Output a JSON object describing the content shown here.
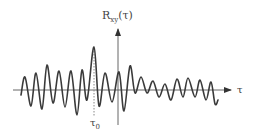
{
  "diagram": {
    "y_axis_label": {
      "main": "R",
      "sub": "xy",
      "arg": "(τ)"
    },
    "x_axis_label": "τ",
    "marker_label": {
      "main": "τ",
      "sub": "0"
    },
    "colors": {
      "curve": "#3a3a3a",
      "axis": "#555555",
      "marker": "#888888"
    }
  },
  "chart_data": {
    "type": "line",
    "xlabel": "τ",
    "ylabel": "R_xy(τ)",
    "annotations": [
      "τ0 (dashed line at maximum peak)"
    ],
    "points_px": [
      [
        21,
        95
      ],
      [
        25,
        77
      ],
      [
        31,
        106
      ],
      [
        36,
        73
      ],
      [
        42,
        109
      ],
      [
        47,
        65
      ],
      [
        53,
        103
      ],
      [
        59,
        71
      ],
      [
        65,
        107
      ],
      [
        71,
        71
      ],
      [
        77,
        115
      ],
      [
        82,
        70
      ],
      [
        87,
        100
      ],
      [
        94,
        47
      ],
      [
        99,
        106
      ],
      [
        105,
        73
      ],
      [
        112,
        102
      ],
      [
        119,
        72
      ],
      [
        124,
        111
      ],
      [
        130,
        66
      ],
      [
        135,
        93
      ],
      [
        141,
        77
      ],
      [
        147,
        93
      ],
      [
        153,
        81
      ],
      [
        159,
        97
      ],
      [
        165,
        84
      ],
      [
        171,
        100
      ],
      [
        177,
        79
      ],
      [
        183,
        97
      ],
      [
        188,
        78
      ],
      [
        195,
        97
      ],
      [
        200,
        80
      ],
      [
        206,
        100
      ],
      [
        211,
        82
      ],
      [
        215,
        104
      ],
      [
        218,
        100
      ]
    ]
  }
}
